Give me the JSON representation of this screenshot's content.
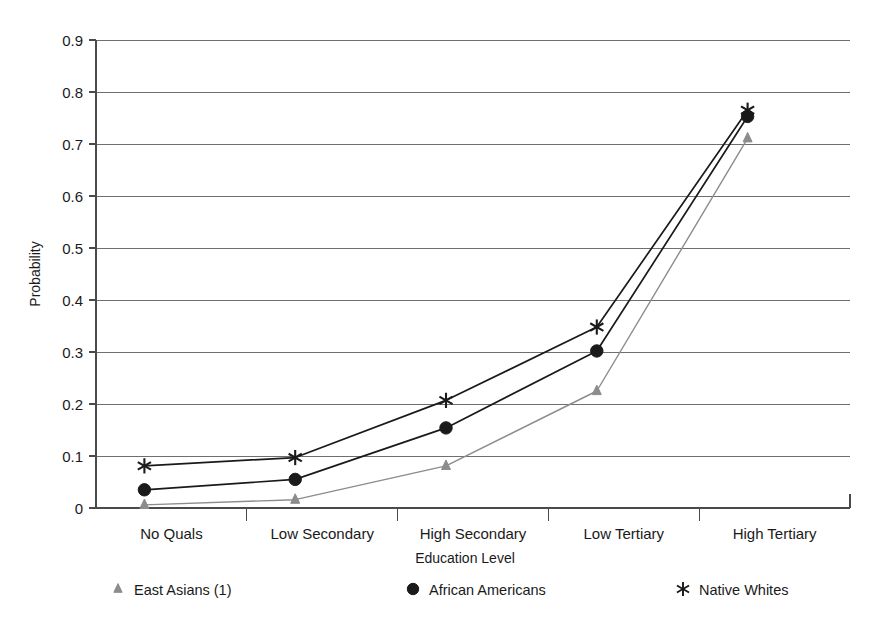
{
  "chart_data": {
    "type": "line",
    "title": "",
    "xlabel": "Education Level",
    "ylabel": "Probability",
    "categories": [
      "No Quals",
      "Low Secondary",
      "High Secondary",
      "Low Tertiary",
      "High Tertiary"
    ],
    "ylim": [
      0,
      0.9
    ],
    "ytick_labels": [
      "0",
      "0.1",
      "0.2",
      "0.3",
      "0.4",
      "0.5",
      "0.6",
      "0.7",
      "0.8",
      "0.9"
    ],
    "ytick_values": [
      0,
      0.1,
      0.2,
      0.3,
      0.4,
      0.5,
      0.6,
      0.7,
      0.8,
      0.9
    ],
    "grid": true,
    "legend_position": "bottom",
    "series": [
      {
        "name": "East Asians (1)",
        "marker": "triangle-up",
        "color": "#8c8c8c",
        "values": [
          0.006,
          0.016,
          0.081,
          0.225,
          0.711
        ]
      },
      {
        "name": "African Americans",
        "marker": "circle",
        "color": "#1a1a1a",
        "values": [
          0.035,
          0.055,
          0.154,
          0.302,
          0.753
        ]
      },
      {
        "name": "Native Whites",
        "marker": "asterisk",
        "color": "#1a1a1a",
        "values": [
          0.081,
          0.097,
          0.207,
          0.348,
          0.765
        ]
      }
    ]
  },
  "legend": {
    "items": [
      {
        "label": "East Asians (1)"
      },
      {
        "label": "African Americans"
      },
      {
        "label": "Native Whites"
      }
    ]
  }
}
